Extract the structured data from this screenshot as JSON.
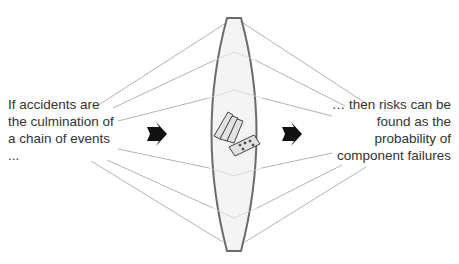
{
  "left_text": {
    "lines": [
      "If accidents are",
      "the culmination of",
      "a chain of events",
      "..."
    ]
  },
  "right_text": {
    "lines": [
      "… then risks can be",
      "found as the",
      "probability of",
      "component failures"
    ]
  },
  "icons": {
    "left_arrow": "right-arrow-icon",
    "right_arrow": "right-arrow-icon",
    "center": "falling-dominoes-icon",
    "lens": "lens-shape"
  },
  "colors": {
    "lens_stroke": "#6b6b6b",
    "lens_fill": "#f3f3f3",
    "ray_lines": "#9a9a9a",
    "text": "#333333",
    "arrow": "#111111"
  }
}
